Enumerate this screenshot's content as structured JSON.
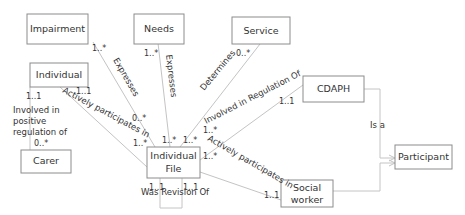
{
  "entities": {
    "impairment": "Impairment",
    "needs": "Needs",
    "service": "Service",
    "individual": "Individual",
    "cdaph": "CDAPH",
    "individual_file_line1": "Individual",
    "individual_file_line2": "File",
    "carer": "Carer",
    "participant": "Participant",
    "social_worker_line1": "Social",
    "social_worker_line2": "worker"
  },
  "relations": {
    "impairment_expresses": {
      "label": "Expresses",
      "source_mult": "1..*"
    },
    "needs_expresses": {
      "label": "Expresses",
      "source_mult": "1..*",
      "target_mult": "1..*"
    },
    "service_determines": {
      "label": "Determines",
      "source_mult": "0..*",
      "target_mult": "1..*"
    },
    "individual_participates": {
      "label": "Actively participates in",
      "source_mult": "1..1",
      "target_mult": "0..*",
      "target_mult2": "1..*"
    },
    "individual_carer": {
      "label_line1": "Involved in",
      "label_line2": "positive",
      "label_line3": "regulation of",
      "source_mult": "1..1",
      "target_mult": "0..*"
    },
    "cdaph_regulation": {
      "label": "Involved in Regulation Of",
      "source_mult": "1..1",
      "target_mult": "1..*"
    },
    "social_worker_participates": {
      "label": "Actively participates in",
      "source_mult": "1..1",
      "target_mult": "1..*"
    },
    "revision": {
      "label": "Was Revision Of",
      "mult_left": "1..1",
      "mult_right": "1..1"
    },
    "is_a": {
      "label": "Is a"
    }
  }
}
